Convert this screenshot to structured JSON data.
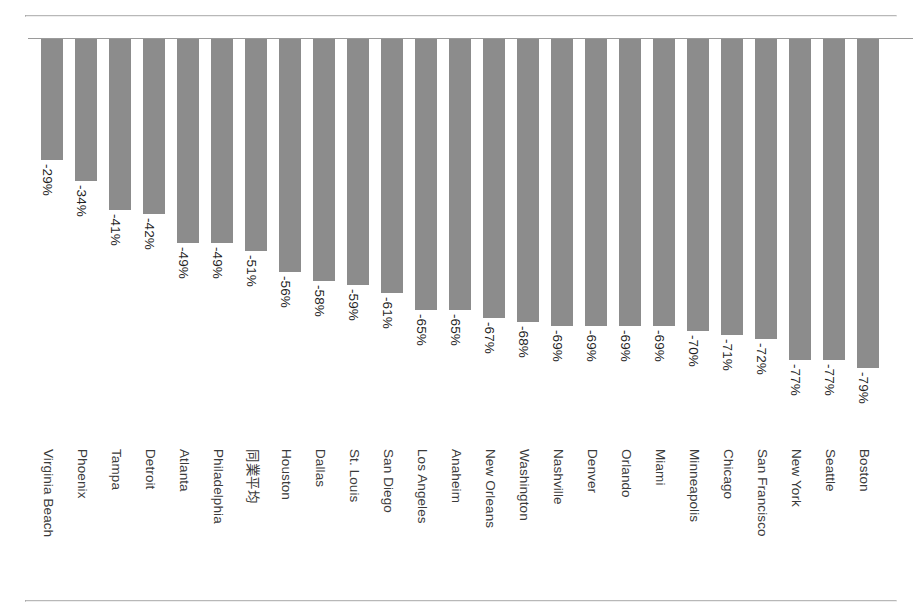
{
  "chart_data": {
    "type": "bar",
    "title": "",
    "subtitle": "",
    "xlabel": "",
    "ylabel": "",
    "ylim": [
      -85,
      0
    ],
    "grid": false,
    "legend": null,
    "orientation": "vertical",
    "bar_color": "#8c8c8c",
    "axis_color": "#9a9a9a",
    "value_suffix": "%",
    "categories": [
      "Virginia Beach",
      "Phoenix",
      "Tampa",
      "Detroit",
      "Atlanta",
      "Philadelphia",
      "同業平均",
      "Houston",
      "Dallas",
      "St. Louis",
      "San Diego",
      "Los Angeles",
      "Anaheim",
      "New Orleans",
      "Washington",
      "Nashville",
      "Denver",
      "Orlando",
      "Miami",
      "Minneapolis",
      "Chicago",
      "San Francisco",
      "New York",
      "Seattle",
      "Boston"
    ],
    "values": [
      -29,
      -34,
      -41,
      -42,
      -49,
      -49,
      -51,
      -56,
      -58,
      -59,
      -61,
      -65,
      -65,
      -67,
      -68,
      -69,
      -69,
      -69,
      -69,
      -70,
      -71,
      -72,
      -77,
      -77,
      -79
    ],
    "data_labels": [
      "-29%",
      "-34%",
      "-41%",
      "-42%",
      "-49%",
      "-49%",
      "-51%",
      "-56%",
      "-58%",
      "-59%",
      "-61%",
      "-65%",
      "-65%",
      "-67%",
      "-68%",
      "-69%",
      "-69%",
      "-69%",
      "-69%",
      "-70%",
      "-71%",
      "-72%",
      "-77%",
      "-77%",
      "-79%"
    ],
    "series": [
      {
        "name": "",
        "values": [
          -29,
          -34,
          -41,
          -42,
          -49,
          -49,
          -51,
          -56,
          -58,
          -59,
          -61,
          -65,
          -65,
          -67,
          -68,
          -69,
          -69,
          -69,
          -69,
          -70,
          -71,
          -72,
          -77,
          -77,
          -80
        ]
      }
    ],
    "points": [
      {
        "category": "Virginia Beach",
        "value": -29,
        "label": "-29%"
      },
      {
        "category": "Phoenix",
        "value": -34,
        "label": "-34%"
      },
      {
        "category": "Tampa",
        "value": -41,
        "label": "-41%"
      },
      {
        "category": "Detroit",
        "value": -42,
        "label": "-42%"
      },
      {
        "category": "Atlanta",
        "value": -49,
        "label": "-49%"
      },
      {
        "category": "Philadelphia",
        "value": -49,
        "label": "-49%"
      },
      {
        "category": "同業平均",
        "value": -51,
        "label": "-51%"
      },
      {
        "category": "Houston",
        "value": -56,
        "label": "-56%"
      },
      {
        "category": "Dallas",
        "value": -58,
        "label": "-58%"
      },
      {
        "category": "St. Louis",
        "value": -59,
        "label": "-59%"
      },
      {
        "category": "San Diego",
        "value": -61,
        "label": "-61%"
      },
      {
        "category": "Los Angeles",
        "value": -65,
        "label": "-65%"
      },
      {
        "category": "Anaheim",
        "value": -65,
        "label": "-65%"
      },
      {
        "category": "New Orleans",
        "value": -67,
        "label": "-67%"
      },
      {
        "category": "Washington",
        "value": -68,
        "label": "-68%"
      },
      {
        "category": "Nashville",
        "value": -69,
        "label": "-69%"
      },
      {
        "category": "Denver",
        "value": -69,
        "label": "-69%"
      },
      {
        "category": "Orlando",
        "value": -69,
        "label": "-69%"
      },
      {
        "category": "Miami",
        "value": -69,
        "label": "-69%"
      },
      {
        "category": "Minneapolis",
        "value": -70,
        "label": "-70%"
      },
      {
        "category": "Chicago",
        "value": -71,
        "label": "-71%"
      },
      {
        "category": "San Francisco",
        "value": -72,
        "label": "-72%"
      },
      {
        "category": "New York",
        "value": -77,
        "label": "-77%"
      },
      {
        "category": "Seattle",
        "value": -77,
        "label": "-77%"
      },
      {
        "category": "Boston",
        "value": -79,
        "label": "-79%"
      }
    ]
  }
}
